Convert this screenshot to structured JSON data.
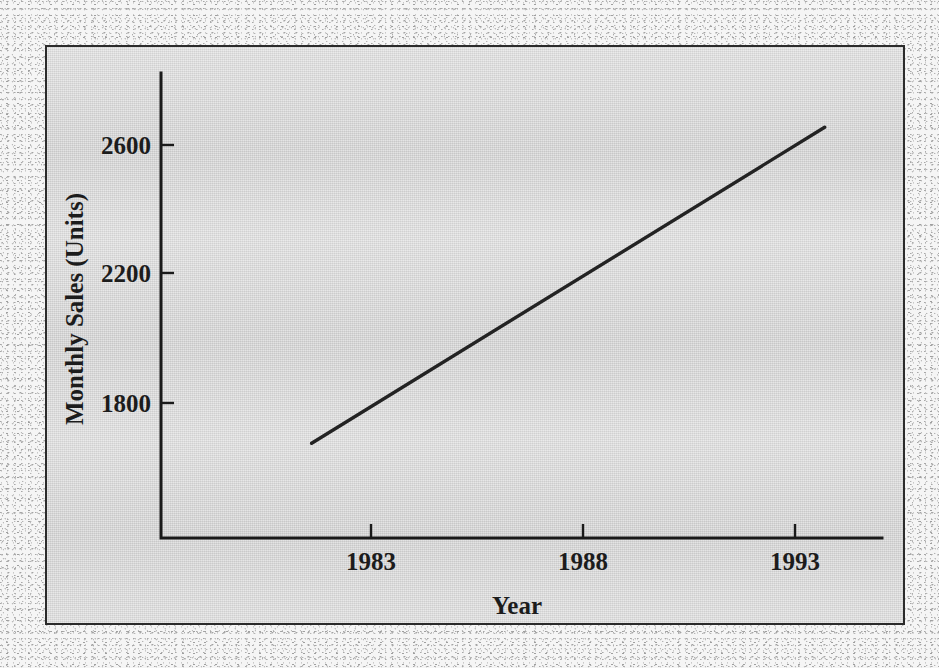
{
  "figure": {
    "background_color": "#d9d9d9",
    "frame_color": "#2b2b2b",
    "ink_color": "#232323"
  },
  "chart_data": {
    "type": "line",
    "title": "",
    "subtitle": "",
    "xlabel": "Year",
    "ylabel": "Monthly Sales (Units)",
    "xlim": [
      1980.0,
      1995.0
    ],
    "ylim": [
      1400,
      2800
    ],
    "xticks": [
      1983,
      1988,
      1993
    ],
    "xtick_labels": [
      "1983",
      "1988",
      "1993"
    ],
    "yticks": [
      1800,
      2200,
      2600
    ],
    "ytick_labels": [
      "1800",
      "2200",
      "2600"
    ],
    "grid": false,
    "legend": false,
    "legend_position": "none",
    "series": [
      {
        "name": "Monthly Sales Trend",
        "style": "solid-straight-line",
        "color": "#232323",
        "x": [
          1981.6,
          1993.7
        ],
        "values": [
          1675,
          2655
        ]
      }
    ],
    "annotations": []
  }
}
